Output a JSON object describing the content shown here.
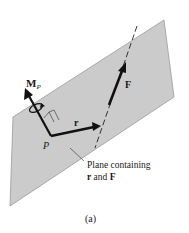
{
  "figure": {
    "caption": "(a)",
    "labels": {
      "moment": "M",
      "moment_subscript": "P",
      "point": "P",
      "position_vector": "r",
      "force": "F"
    },
    "annotation": {
      "line1": "Plane containing",
      "line2_bold_r": "r",
      "line2_mid": " and ",
      "line2_bold_F": "F"
    },
    "colors": {
      "plane_fill": "#c8c8c8",
      "plane_edge": "#9a9a9a",
      "vector": "#111111",
      "background": "#ffffff"
    }
  }
}
